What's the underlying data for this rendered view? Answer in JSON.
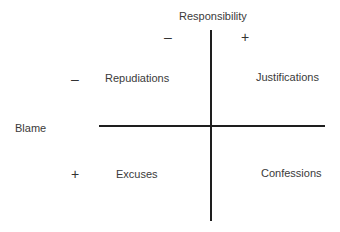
{
  "axes": {
    "vertical": {
      "label": "Responsibility",
      "minus": "–",
      "plus": "+"
    },
    "horizontal": {
      "label": "Blame",
      "minus": "–",
      "plus": "+"
    }
  },
  "quadrants": {
    "top_left": "Repudiations",
    "top_right": "Justifications",
    "bottom_left": "Excuses",
    "bottom_right": "Confessions"
  },
  "colors": {
    "line": "#1e1e1e",
    "text": "#3a3a3a"
  }
}
